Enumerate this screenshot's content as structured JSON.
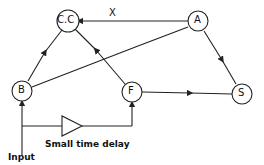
{
  "nodes": [
    {
      "id": "CC",
      "label": "C.C",
      "x": 68,
      "y": 21
    },
    {
      "id": "A",
      "label": "A",
      "x": 198,
      "y": 21
    },
    {
      "id": "B",
      "label": "B",
      "x": 22,
      "y": 91
    },
    {
      "id": "F",
      "label": "F",
      "x": 132,
      "y": 92
    },
    {
      "id": "S",
      "label": "S",
      "x": 242,
      "y": 94
    }
  ],
  "edges": [
    {
      "from": "B",
      "to": "CC"
    },
    {
      "from": "F",
      "to": "CC"
    },
    {
      "from": "A",
      "to": "CC",
      "label": "X"
    },
    {
      "from": "B",
      "to": "A"
    },
    {
      "from": "A",
      "to": "S"
    },
    {
      "from": "F",
      "to": "S"
    },
    {
      "from": "Input",
      "to": "B"
    },
    {
      "from": "Input",
      "to": "F",
      "via": "Small time delay"
    }
  ],
  "labels": {
    "edge_x": "X",
    "delay": "Small time delay",
    "input": "Input"
  },
  "colors": {
    "stroke": "#222222",
    "background": "#ffffff"
  }
}
